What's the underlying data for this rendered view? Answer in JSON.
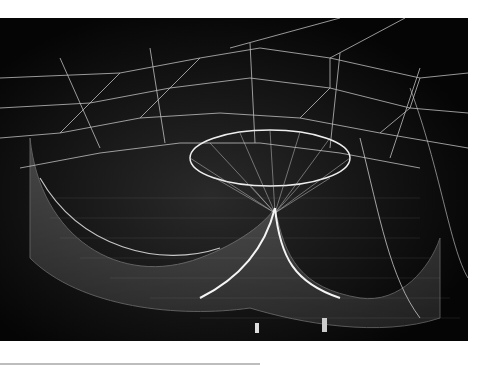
{
  "image": {
    "subject": "Suspended net sculpture illuminated against dark night sky",
    "alt": "White netted aerial sculpture with a central oval ring and draping mesh funnels",
    "colors": {
      "background": "#050505",
      "net": "#e8e8e8",
      "page": "#ffffff"
    }
  }
}
